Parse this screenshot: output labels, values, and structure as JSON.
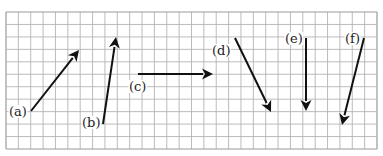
{
  "diagram": {
    "type": "vector-arrows-on-grid",
    "grid": {
      "left": 6,
      "top": 12,
      "right": 377,
      "bottom": 149,
      "columns": 30,
      "rows": 11,
      "line_color": "#b4b4b4",
      "border_color": "#9a9a9a"
    },
    "arrow_color": "#111111",
    "label_color": "#222222",
    "arrows": [
      {
        "id": "a",
        "label": "(a)",
        "x1": 31,
        "y1": 111,
        "x2": 79,
        "y2": 50,
        "label_x": 9,
        "label_y": 116
      },
      {
        "id": "b",
        "label": "(b)",
        "x1": 103,
        "y1": 124,
        "x2": 116,
        "y2": 37,
        "label_x": 82,
        "label_y": 127
      },
      {
        "id": "c",
        "label": "(c)",
        "x1": 138,
        "y1": 74,
        "x2": 213,
        "y2": 74,
        "label_x": 129,
        "label_y": 91
      },
      {
        "id": "d",
        "label": "(d)",
        "x1": 235,
        "y1": 38,
        "x2": 271,
        "y2": 112,
        "label_x": 212,
        "label_y": 55
      },
      {
        "id": "e",
        "label": "(e)",
        "x1": 306,
        "y1": 38,
        "x2": 306,
        "y2": 111,
        "label_x": 285,
        "label_y": 43
      },
      {
        "id": "f",
        "label": "(f)",
        "x1": 364,
        "y1": 38,
        "x2": 342,
        "y2": 125,
        "label_x": 345,
        "label_y": 43
      }
    ]
  }
}
